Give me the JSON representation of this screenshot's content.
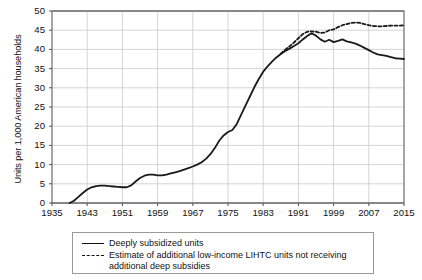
{
  "chart_data": {
    "type": "line",
    "title": "",
    "xlabel": "",
    "ylabel": "Units per 1,000 American households",
    "xlim": [
      1935,
      2015
    ],
    "ylim": [
      0,
      50
    ],
    "grid": true,
    "legend_position": "below-plot",
    "xticks": [
      1935,
      1943,
      1951,
      1959,
      1967,
      1975,
      1983,
      1991,
      1999,
      2007,
      2015
    ],
    "yticks": [
      0,
      5,
      10,
      15,
      20,
      25,
      30,
      35,
      40,
      45,
      50
    ],
    "series": [
      {
        "name": "Deeply subsidized units",
        "style": "solid",
        "color": "#1a1a1a",
        "x": [
          1939,
          1940,
          1941,
          1942,
          1943,
          1944,
          1945,
          1946,
          1947,
          1948,
          1949,
          1950,
          1951,
          1952,
          1953,
          1954,
          1955,
          1956,
          1957,
          1958,
          1959,
          1960,
          1961,
          1962,
          1963,
          1964,
          1965,
          1966,
          1967,
          1968,
          1969,
          1970,
          1971,
          1972,
          1973,
          1974,
          1975,
          1976,
          1977,
          1978,
          1979,
          1980,
          1981,
          1982,
          1983,
          1984,
          1985,
          1986,
          1987,
          1988,
          1989,
          1990,
          1991,
          1992,
          1993,
          1994,
          1995,
          1996,
          1997,
          1998,
          1999,
          2000,
          2001,
          2002,
          2003,
          2004,
          2005,
          2006,
          2007,
          2008,
          2009,
          2010,
          2011,
          2012,
          2013,
          2014,
          2015
        ],
        "y": [
          0.0,
          0.6,
          1.6,
          2.6,
          3.5,
          4.1,
          4.4,
          4.5,
          4.5,
          4.4,
          4.3,
          4.2,
          4.1,
          4.1,
          4.6,
          5.6,
          6.5,
          7.1,
          7.4,
          7.4,
          7.2,
          7.2,
          7.4,
          7.7,
          8.0,
          8.3,
          8.7,
          9.1,
          9.5,
          10.0,
          10.6,
          11.5,
          12.7,
          14.3,
          16.2,
          17.6,
          18.5,
          19.0,
          20.6,
          23.0,
          25.4,
          27.8,
          30.2,
          32.3,
          34.2,
          35.6,
          36.8,
          37.9,
          38.8,
          39.6,
          40.2,
          40.9,
          41.6,
          42.6,
          43.5,
          44.2,
          43.6,
          42.6,
          42.0,
          42.5,
          41.9,
          42.2,
          42.6,
          42.1,
          41.8,
          41.5,
          41.0,
          40.4,
          39.8,
          39.2,
          38.7,
          38.5,
          38.3,
          38.0,
          37.7,
          37.6,
          37.5
        ]
      },
      {
        "name": "Estimate of additional low-income LIHTC units not receiving additional deep subsidies",
        "style": "dashed",
        "color": "#1a1a1a",
        "x": [
          1987,
          1988,
          1989,
          1990,
          1991,
          1992,
          1993,
          1994,
          1995,
          1996,
          1997,
          1998,
          1999,
          2000,
          2001,
          2002,
          2003,
          2004,
          2005,
          2006,
          2007,
          2008,
          2009,
          2010,
          2011,
          2012,
          2013,
          2014,
          2015
        ],
        "y": [
          38.9,
          39.9,
          40.8,
          41.8,
          42.9,
          44.0,
          44.6,
          44.7,
          44.6,
          44.3,
          44.4,
          45.0,
          45.2,
          45.8,
          46.3,
          46.6,
          46.9,
          47.0,
          46.9,
          46.6,
          46.3,
          46.1,
          46.0,
          46.0,
          46.1,
          46.2,
          46.2,
          46.2,
          46.3
        ]
      }
    ]
  },
  "axes": {
    "ylabel": "Units per 1,000 American households",
    "yticks": [
      "0",
      "5",
      "10",
      "15",
      "20",
      "25",
      "30",
      "35",
      "40",
      "45",
      "50"
    ],
    "xticks": [
      "1935",
      "1943",
      "1951",
      "1959",
      "1967",
      "1975",
      "1983",
      "1991",
      "1999",
      "2007",
      "2015"
    ]
  },
  "legend": {
    "items": [
      {
        "label": "Deeply subsidized units",
        "style": "solid"
      },
      {
        "label": "Estimate of additional low-income LIHTC units not receiving additional deep subsidies",
        "style": "dashed"
      }
    ]
  }
}
